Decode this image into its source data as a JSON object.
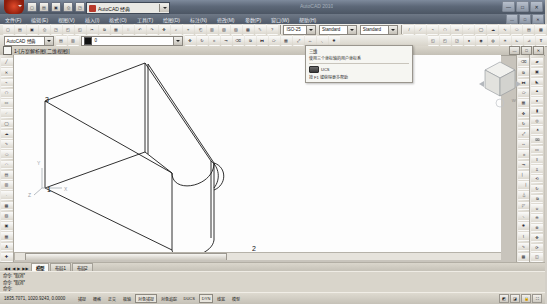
{
  "window": {
    "title": "AutoCAD 2010",
    "workspace_label": "AutoCAD 经典",
    "minimize": "—",
    "maximize": "□",
    "close": "✕"
  },
  "quick_access": [
    {
      "name": "new",
      "glyph": "▢"
    },
    {
      "name": "open",
      "glyph": "▤"
    },
    {
      "name": "save",
      "glyph": "▣"
    },
    {
      "name": "print",
      "glyph": "⎙"
    },
    {
      "name": "plot-preview",
      "glyph": "◳"
    },
    {
      "name": "undo",
      "glyph": "↶"
    },
    {
      "name": "redo",
      "glyph": "↷"
    }
  ],
  "menubar": {
    "items": [
      {
        "label": "文件(F)"
      },
      {
        "label": "编辑(E)"
      },
      {
        "label": "视图(V)"
      },
      {
        "label": "插入(I)"
      },
      {
        "label": "格式(O)"
      },
      {
        "label": "工具(T)"
      },
      {
        "label": "绘图(D)"
      },
      {
        "label": "标注(N)"
      },
      {
        "label": "修改(M)"
      },
      {
        "label": "参数(P)"
      },
      {
        "label": "窗口(W)"
      },
      {
        "label": "帮助(H)"
      }
    ],
    "win_buttons": [
      "—",
      "□",
      "✕"
    ]
  },
  "toolbar_row1": {
    "buttons": [
      {
        "name": "qnew",
        "glyph": "▢"
      },
      {
        "name": "open",
        "glyph": "▤"
      },
      {
        "name": "save",
        "glyph": "▣"
      },
      {
        "name": "plot",
        "glyph": "⎙"
      },
      {
        "name": "plot-preview",
        "glyph": "◳"
      },
      {
        "name": "publish",
        "glyph": "◰"
      },
      {
        "name": "3dprint",
        "glyph": "◱"
      },
      {
        "name": "cut",
        "glyph": "✂"
      },
      {
        "name": "copy",
        "glyph": "⧉"
      },
      {
        "name": "paste",
        "glyph": "▦"
      },
      {
        "name": "matchprop",
        "glyph": "⌷"
      },
      {
        "name": "undo",
        "glyph": "↶"
      },
      {
        "name": "redo",
        "glyph": "↷"
      },
      {
        "name": "pan",
        "glyph": "✥"
      },
      {
        "name": "zoom-realtime",
        "glyph": "⌕"
      },
      {
        "name": "zoom-window",
        "glyph": "⌖"
      },
      {
        "name": "zoom-previous",
        "glyph": "⎗"
      },
      {
        "name": "properties",
        "glyph": "▥"
      },
      {
        "name": "designcenter",
        "glyph": "▧"
      },
      {
        "name": "toolpalette",
        "glyph": "▨"
      },
      {
        "name": "sheetset",
        "glyph": "▩"
      },
      {
        "name": "markup",
        "glyph": "✎"
      },
      {
        "name": "help",
        "glyph": "?"
      }
    ],
    "dim_style_label": "Standard",
    "combos": [
      {
        "name": "dimstyle",
        "value": "ISO-25"
      },
      {
        "name": "textstyle",
        "value": "Standard"
      },
      {
        "name": "tablestyle",
        "value": "Standard"
      }
    ],
    "right_buttons": [
      {
        "name": "line",
        "glyph": "/"
      },
      {
        "name": "ray",
        "glyph": "⟋"
      },
      {
        "name": "polyline",
        "glyph": "⌁"
      },
      {
        "name": "polygon",
        "glyph": "⬠"
      },
      {
        "name": "rectangle",
        "glyph": "▭"
      },
      {
        "name": "arc",
        "glyph": "◜"
      },
      {
        "name": "circle",
        "glyph": "◯"
      },
      {
        "name": "revcloud",
        "glyph": "☁"
      },
      {
        "name": "spline",
        "glyph": "∿"
      },
      {
        "name": "ellipse",
        "glyph": "⬭"
      },
      {
        "name": "block",
        "glyph": "▤"
      },
      {
        "name": "hatch",
        "glyph": "▩"
      }
    ]
  },
  "toolbar_row2": {
    "layer_workspace": "AutoCAD 经典",
    "layer_buttons": [
      {
        "name": "layer-properties",
        "glyph": "▤"
      },
      {
        "name": "layer-state",
        "glyph": "▥"
      }
    ],
    "layer_value": "0",
    "color_value": "ByLayer",
    "linetype_value": "ByLayer",
    "lineweight_value": "ByLayer",
    "buttons": [
      {
        "name": "move",
        "glyph": "✥"
      },
      {
        "name": "rotate",
        "glyph": "↻"
      },
      {
        "name": "trim",
        "glyph": "⌗"
      },
      {
        "name": "extend",
        "glyph": "⇥"
      },
      {
        "name": "erase",
        "glyph": "⌫"
      },
      {
        "name": "copy-object",
        "glyph": "⧉"
      },
      {
        "name": "mirror",
        "glyph": "⧓"
      },
      {
        "name": "offset",
        "glyph": "⧂"
      },
      {
        "name": "array",
        "glyph": "▦"
      },
      {
        "name": "scale",
        "glyph": "⤢"
      },
      {
        "name": "stretch",
        "glyph": "↔"
      },
      {
        "name": "fillet",
        "glyph": "◟"
      },
      {
        "name": "explode",
        "glyph": "✸"
      }
    ],
    "right_buttons": [
      {
        "name": "visual-style-2dwire",
        "glyph": "◱"
      },
      {
        "name": "visual-style-3dwire",
        "glyph": "◰"
      },
      {
        "name": "visual-style-hidden",
        "glyph": "◲"
      },
      {
        "name": "render",
        "glyph": "●"
      },
      {
        "name": "light",
        "glyph": "◉"
      },
      {
        "name": "material",
        "glyph": "◍"
      },
      {
        "name": "sun",
        "glyph": "☀"
      },
      {
        "name": "ucs",
        "glyph": "⊾"
      },
      {
        "name": "ucs-world",
        "glyph": "⊿"
      },
      {
        "name": "ucs-manage",
        "glyph": "⊽"
      }
    ]
  },
  "drawing_window": {
    "title": "1-[方案解析图(二维视图)]",
    "buttons": [
      "—",
      "□",
      "✕"
    ]
  },
  "left_toolbar": {
    "name": "draw-toolbar",
    "buttons": [
      {
        "name": "line",
        "glyph": "╱"
      },
      {
        "name": "construction-line",
        "glyph": "✕"
      },
      {
        "name": "polyline",
        "glyph": "⌁"
      },
      {
        "name": "polygon",
        "glyph": "⬠"
      },
      {
        "name": "rectangle",
        "glyph": "▭"
      },
      {
        "name": "arc",
        "glyph": "◜"
      },
      {
        "name": "circle",
        "glyph": "◯"
      },
      {
        "name": "revision-cloud",
        "glyph": "☁"
      },
      {
        "name": "spline",
        "glyph": "∿"
      },
      {
        "name": "ellipse",
        "glyph": "⬭"
      },
      {
        "name": "ellipse-arc",
        "glyph": "◠"
      },
      {
        "name": "insert-block",
        "glyph": "▤"
      },
      {
        "name": "make-block",
        "glyph": "▥"
      },
      {
        "name": "point",
        "glyph": "·"
      },
      {
        "name": "hatch",
        "glyph": "▩"
      },
      {
        "name": "gradient",
        "glyph": "▨"
      },
      {
        "name": "region",
        "glyph": "▣"
      },
      {
        "name": "table",
        "glyph": "▦"
      },
      {
        "name": "multiline-text",
        "glyph": "A"
      },
      {
        "name": "add-selected",
        "glyph": "✚"
      }
    ]
  },
  "right_toolbar_1": {
    "name": "modify-toolbar",
    "buttons": [
      {
        "name": "erase",
        "glyph": "⌫"
      },
      {
        "name": "copy",
        "glyph": "⧉"
      },
      {
        "name": "mirror",
        "glyph": "⧓"
      },
      {
        "name": "offset",
        "glyph": "⧂"
      },
      {
        "name": "array",
        "glyph": "▦"
      },
      {
        "name": "move",
        "glyph": "✥"
      },
      {
        "name": "rotate",
        "glyph": "↻"
      },
      {
        "name": "scale",
        "glyph": "⤢"
      },
      {
        "name": "stretch",
        "glyph": "↔"
      },
      {
        "name": "trim",
        "glyph": "⌗"
      },
      {
        "name": "extend",
        "glyph": "⇥"
      },
      {
        "name": "break-at-point",
        "glyph": "⎸"
      },
      {
        "name": "break",
        "glyph": "⎹"
      },
      {
        "name": "join",
        "glyph": "⏃"
      },
      {
        "name": "chamfer",
        "glyph": "◸"
      },
      {
        "name": "fillet",
        "glyph": "◟"
      },
      {
        "name": "explode",
        "glyph": "✸"
      },
      {
        "name": "edit-polyline",
        "glyph": "⌇"
      },
      {
        "name": "edit-spline",
        "glyph": "∿"
      },
      {
        "name": "edit-hatch",
        "glyph": "▩"
      }
    ]
  },
  "right_toolbar_2": {
    "name": "modeling-toolbar",
    "buttons": [
      {
        "name": "polysolid",
        "glyph": "▰"
      },
      {
        "name": "box",
        "glyph": "▣"
      },
      {
        "name": "wedge",
        "glyph": "◣"
      },
      {
        "name": "cone",
        "glyph": "▲"
      },
      {
        "name": "sphere",
        "glyph": "●"
      },
      {
        "name": "cylinder",
        "glyph": "▮"
      },
      {
        "name": "torus",
        "glyph": "◎"
      },
      {
        "name": "pyramid",
        "glyph": "⯅"
      },
      {
        "name": "helix",
        "glyph": "➿"
      },
      {
        "name": "planar-surface",
        "glyph": "▭"
      },
      {
        "name": "extrude",
        "glyph": "⇪"
      },
      {
        "name": "presspull",
        "glyph": "⇫"
      },
      {
        "name": "sweep",
        "glyph": "⟲"
      },
      {
        "name": "revolve",
        "glyph": "↻"
      },
      {
        "name": "loft",
        "glyph": "⧉"
      },
      {
        "name": "union",
        "glyph": "⊍"
      },
      {
        "name": "subtract",
        "glyph": "⊖"
      },
      {
        "name": "intersect",
        "glyph": "⊗"
      },
      {
        "name": "3d-move",
        "glyph": "✥"
      },
      {
        "name": "3d-rotate",
        "glyph": "⟳"
      },
      {
        "name": "section-plane",
        "glyph": "◫"
      }
    ]
  },
  "tooltip": {
    "title": "三维",
    "description": "使用三个坐标轴的用户坐标系",
    "command": "UCS",
    "hint": "按 F1 键获得更多帮助"
  },
  "viewcube": {
    "label": "WCS"
  },
  "canvas": {
    "ucs_x": "X",
    "ucs_y": "Y",
    "ucs_z": "Z",
    "vertex_labels": [
      {
        "id": "3",
        "x": 31,
        "y": 41
      },
      {
        "id": "1",
        "x": 33,
        "y": 131
      },
      {
        "id": "2",
        "x": 238,
        "y": 190
      }
    ]
  },
  "tabs": {
    "nav": [
      "◀◀",
      "◀",
      "▶",
      "▶▶"
    ],
    "items": [
      {
        "label": "模型",
        "active": true
      },
      {
        "label": "布局1",
        "active": false
      },
      {
        "label": "布局2",
        "active": false
      }
    ]
  },
  "command_line": {
    "lines": [
      "命令: *取消*",
      "命令: *取消*",
      "命令:"
    ]
  },
  "status_bar": {
    "coordinates": "1835.7071, 1020.9243, 0.0000",
    "toggles": [
      {
        "label": "捕捉",
        "on": false
      },
      {
        "label": "栅格",
        "on": false
      },
      {
        "label": "正交",
        "on": false
      },
      {
        "label": "极轴",
        "on": false
      },
      {
        "label": "对象捕捉",
        "on": true
      },
      {
        "label": "对象追踪",
        "on": false
      },
      {
        "label": "DUCS",
        "on": false
      },
      {
        "label": "DYN",
        "on": true
      },
      {
        "label": "线宽",
        "on": false
      },
      {
        "label": "模型",
        "on": false
      }
    ],
    "right_icons": [
      {
        "name": "annotation-scale",
        "glyph": "◩"
      },
      {
        "name": "annotation-visibility",
        "glyph": "◪"
      },
      {
        "name": "lock-ui",
        "glyph": "🔒"
      },
      {
        "name": "clean-screen",
        "glyph": "⛶"
      }
    ]
  },
  "colors": {
    "title_bar": "#5d6878",
    "menu_bar": "#515b6a",
    "toolbar": "#dcd8ce",
    "canvas": "#fdfdfd",
    "geometry_stroke": "#1a1a1a",
    "app_button": "#b8382a"
  }
}
